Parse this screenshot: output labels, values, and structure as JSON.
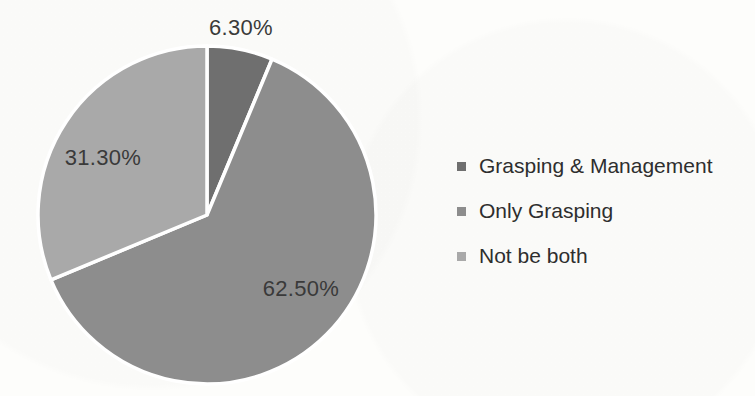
{
  "chart_data": {
    "type": "pie",
    "title": "",
    "categories": [
      "Grasping & Management",
      "Only Grasping",
      "Not be both"
    ],
    "values": [
      6.3,
      62.5,
      31.3
    ],
    "slices": [
      {
        "label": "Grasping & Management",
        "value": 6.3,
        "display": "6.30%",
        "color": "#6f6f6f"
      },
      {
        "label": "Only Grasping",
        "value": 62.5,
        "display": "62.50%",
        "color": "#8d8d8d"
      },
      {
        "label": "Not be both",
        "value": 31.3,
        "display": "31.30%",
        "color": "#a9a9a9"
      }
    ],
    "start_angle_deg": 0,
    "direction": "clockwise",
    "separator_color": "#ffffff",
    "legend_position": "right",
    "label_text_color": "#3a3a3a"
  }
}
